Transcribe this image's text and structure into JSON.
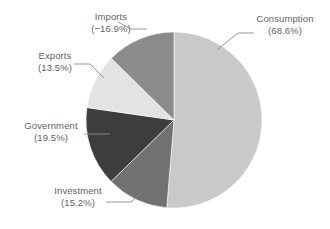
{
  "chart_data": {
    "type": "pie",
    "title": "",
    "subtitle": "",
    "xlabel": "",
    "ylabel": "",
    "legend_position": "none",
    "grid": false,
    "label_format": "{name}\n({value}%)",
    "note": "Components of GDP expressed as percent shares; Imports is a negative share. Slice arc sizes are drawn from absolute values.",
    "slices": [
      {
        "name": "Consumption",
        "value": 68.6,
        "display_value": "68.6%",
        "label_line1": "Consumption",
        "label_line2": "(68.6%)",
        "color": "#c9c9c9",
        "abs_value": 68.6
      },
      {
        "name": "Investment",
        "value": 15.2,
        "display_value": "15.2%",
        "label_line1": "Investment",
        "label_line2": "(15.2%)",
        "color": "#717171",
        "abs_value": 15.2
      },
      {
        "name": "Government",
        "value": 19.5,
        "display_value": "19.5%",
        "label_line1": "Government",
        "label_line2": "(19.5%)",
        "color": "#3d3d3d",
        "abs_value": 19.5
      },
      {
        "name": "Exports",
        "value": 13.5,
        "display_value": "13.5%",
        "label_line1": "Exports",
        "label_line2": "(13.5%)",
        "color": "#e3e3e3",
        "abs_value": 13.5
      },
      {
        "name": "Imports",
        "value": -16.9,
        "display_value": "−16.9%",
        "label_line1": "Imports",
        "label_line2": "(−16.9%)",
        "color": "#8b8b8b",
        "abs_value": 16.9
      }
    ],
    "categories": [
      "Consumption",
      "Investment",
      "Government",
      "Exports",
      "Imports"
    ],
    "values": [
      68.6,
      15.2,
      19.5,
      13.5,
      -16.9
    ],
    "colors": [
      "#c9c9c9",
      "#717171",
      "#3d3d3d",
      "#e3e3e3",
      "#8b8b8b"
    ],
    "background": "#ffffff",
    "text_color": "#5f5f5f",
    "leader_line_color": "#8c8c8c"
  },
  "labels": {
    "consumption": {
      "line1": "Consumption",
      "line2": "(68.6%)"
    },
    "investment": {
      "line1": "Investment",
      "line2": "(15.2%)"
    },
    "government": {
      "line1": "Government",
      "line2": "(19.5%)"
    },
    "exports": {
      "line1": "Exports",
      "line2": "(13.5%)"
    },
    "imports": {
      "line1": "Imports",
      "line2": "(−16.9%)"
    }
  }
}
